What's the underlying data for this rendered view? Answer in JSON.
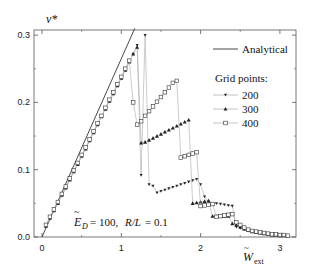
{
  "chart_data": {
    "type": "line",
    "title": "",
    "xlabel": "W_ext (tilde)",
    "ylabel": "v*",
    "xlim": [
      -0.3,
      3.2
    ],
    "ylim": [
      0.0,
      0.31
    ],
    "x_ticks": [
      "0",
      "1",
      "2",
      "3"
    ],
    "y_ticks": [
      "0.0",
      "0.1",
      "0.2",
      "0.3"
    ],
    "grid": false,
    "legend_position": "upper right",
    "annotation": "E_D = 100,  R/L = 0.1",
    "analytical": {
      "name": "Analytical",
      "x": [
        0.0,
        1.17
      ],
      "y": [
        0.0,
        0.31
      ]
    },
    "legend_group_title": "Grid points:",
    "series": [
      {
        "name": "200",
        "marker": "triangle-down",
        "x": [
          0.05,
          0.1,
          0.15,
          0.2,
          0.25,
          0.3,
          0.35,
          0.4,
          0.45,
          0.5,
          0.55,
          0.6,
          0.65,
          0.7,
          0.75,
          0.8,
          0.85,
          0.9,
          0.95,
          1.0,
          1.05,
          1.1,
          1.15,
          1.2,
          1.25,
          1.3,
          1.35,
          1.4,
          1.45,
          1.5,
          1.55,
          1.6,
          1.65,
          1.7,
          1.75,
          1.8,
          1.85,
          1.9,
          1.95,
          2.0,
          2.05,
          2.1,
          2.15,
          2.2,
          2.25,
          2.3,
          2.35,
          2.4,
          2.45,
          2.5,
          2.55,
          2.6,
          2.65,
          2.7,
          2.75,
          2.8,
          2.85,
          2.9,
          2.95,
          3.0,
          3.05,
          3.1
        ],
        "y": [
          0.016,
          0.028,
          0.039,
          0.05,
          0.062,
          0.073,
          0.085,
          0.097,
          0.108,
          0.12,
          0.131,
          0.143,
          0.155,
          0.167,
          0.179,
          0.19,
          0.202,
          0.213,
          0.225,
          0.236,
          0.248,
          0.26,
          0.272,
          0.285,
          0.092,
          0.3,
          0.078,
          0.076,
          0.066,
          0.068,
          0.07,
          0.072,
          0.074,
          0.076,
          0.078,
          0.08,
          0.082,
          0.084,
          0.086,
          0.078,
          0.06,
          0.052,
          0.05,
          0.05,
          0.049,
          0.048,
          0.047,
          0.046,
          0.015,
          0.013,
          0.011,
          0.009,
          0.008,
          0.007,
          0.006,
          0.005,
          0.004,
          0.004,
          0.003,
          0.003,
          0.002,
          0.002
        ]
      },
      {
        "name": "300",
        "marker": "triangle-up",
        "x": [
          0.05,
          0.1,
          0.15,
          0.2,
          0.25,
          0.3,
          0.35,
          0.4,
          0.45,
          0.5,
          0.55,
          0.6,
          0.65,
          0.7,
          0.75,
          0.8,
          0.85,
          0.9,
          0.95,
          1.0,
          1.05,
          1.1,
          1.15,
          1.2,
          1.25,
          1.3,
          1.35,
          1.4,
          1.45,
          1.5,
          1.55,
          1.6,
          1.65,
          1.7,
          1.75,
          1.8,
          1.85,
          1.9,
          1.95,
          2.0,
          2.05,
          2.1,
          2.15,
          2.2,
          2.25,
          2.3,
          2.35,
          2.4,
          2.45,
          2.5,
          2.55,
          2.6,
          2.65,
          2.7,
          2.75,
          2.8,
          2.85,
          2.9,
          2.95,
          3.0,
          3.05,
          3.1
        ],
        "y": [
          0.016,
          0.028,
          0.039,
          0.05,
          0.062,
          0.073,
          0.085,
          0.097,
          0.108,
          0.12,
          0.131,
          0.143,
          0.155,
          0.167,
          0.179,
          0.19,
          0.202,
          0.213,
          0.225,
          0.236,
          0.248,
          0.26,
          0.272,
          0.282,
          0.14,
          0.141,
          0.144,
          0.147,
          0.15,
          0.153,
          0.156,
          0.159,
          0.162,
          0.165,
          0.168,
          0.171,
          0.174,
          0.05,
          0.051,
          0.052,
          0.053,
          0.054,
          0.031,
          0.031,
          0.031,
          0.031,
          0.031,
          0.02,
          0.018,
          0.015,
          0.012,
          0.01,
          0.008,
          0.007,
          0.006,
          0.005,
          0.004,
          0.003,
          0.003,
          0.002,
          0.002,
          0.002
        ]
      },
      {
        "name": "400",
        "marker": "square-open",
        "x": [
          0.05,
          0.1,
          0.15,
          0.2,
          0.25,
          0.3,
          0.35,
          0.4,
          0.45,
          0.5,
          0.55,
          0.6,
          0.65,
          0.7,
          0.75,
          0.8,
          0.85,
          0.9,
          0.95,
          1.0,
          1.05,
          1.1,
          1.15,
          1.2,
          1.25,
          1.3,
          1.35,
          1.4,
          1.45,
          1.5,
          1.55,
          1.6,
          1.65,
          1.7,
          1.75,
          1.8,
          1.85,
          1.9,
          1.95,
          2.0,
          2.05,
          2.1,
          2.15,
          2.2,
          2.25,
          2.3,
          2.35,
          2.4,
          2.45,
          2.5,
          2.55,
          2.6,
          2.65,
          2.7,
          2.75,
          2.8,
          2.85,
          2.9,
          2.95,
          3.0,
          3.05,
          3.1
        ],
        "y": [
          0.018,
          0.03,
          0.041,
          0.052,
          0.064,
          0.075,
          0.087,
          0.099,
          0.11,
          0.122,
          0.133,
          0.145,
          0.157,
          0.169,
          0.18,
          0.192,
          0.204,
          0.215,
          0.227,
          0.238,
          0.25,
          0.262,
          0.2,
          0.167,
          0.172,
          0.18,
          0.187,
          0.194,
          0.201,
          0.208,
          0.215,
          0.222,
          0.229,
          0.232,
          0.118,
          0.12,
          0.122,
          0.124,
          0.126,
          0.046,
          0.047,
          0.048,
          0.049,
          0.03,
          0.031,
          0.032,
          0.033,
          0.034,
          0.022,
          0.018,
          0.014,
          0.011,
          0.009,
          0.008,
          0.007,
          0.006,
          0.005,
          0.004,
          0.004,
          0.003,
          0.003,
          0.002
        ]
      }
    ]
  }
}
